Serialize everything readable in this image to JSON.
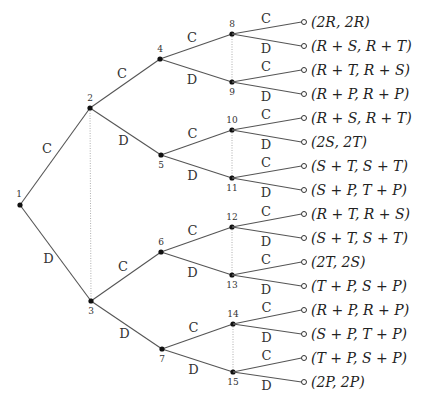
{
  "diagram": {
    "type": "game-tree",
    "nodes": [
      {
        "id": "1",
        "label": "1"
      },
      {
        "id": "2",
        "label": "2"
      },
      {
        "id": "3",
        "label": "3"
      },
      {
        "id": "4",
        "label": "4"
      },
      {
        "id": "5",
        "label": "5"
      },
      {
        "id": "6",
        "label": "6"
      },
      {
        "id": "7",
        "label": "7"
      },
      {
        "id": "8",
        "label": "8"
      },
      {
        "id": "9",
        "label": "9"
      },
      {
        "id": "10",
        "label": "10"
      },
      {
        "id": "11",
        "label": "11"
      },
      {
        "id": "12",
        "label": "12"
      },
      {
        "id": "13",
        "label": "13"
      },
      {
        "id": "14",
        "label": "14"
      },
      {
        "id": "15",
        "label": "15"
      }
    ],
    "edges": [
      {
        "from": "1",
        "to": "2",
        "action": "C"
      },
      {
        "from": "1",
        "to": "3",
        "action": "D"
      },
      {
        "from": "2",
        "to": "4",
        "action": "C"
      },
      {
        "from": "2",
        "to": "5",
        "action": "D"
      },
      {
        "from": "3",
        "to": "6",
        "action": "C"
      },
      {
        "from": "3",
        "to": "7",
        "action": "D"
      },
      {
        "from": "4",
        "to": "8",
        "action": "C"
      },
      {
        "from": "4",
        "to": "9",
        "action": "D"
      },
      {
        "from": "5",
        "to": "10",
        "action": "C"
      },
      {
        "from": "5",
        "to": "11",
        "action": "D"
      },
      {
        "from": "6",
        "to": "12",
        "action": "C"
      },
      {
        "from": "6",
        "to": "13",
        "action": "D"
      },
      {
        "from": "7",
        "to": "14",
        "action": "C"
      },
      {
        "from": "7",
        "to": "15",
        "action": "D"
      }
    ],
    "information_sets": [
      [
        "2",
        "3"
      ],
      [
        "8",
        "9"
      ],
      [
        "10",
        "11"
      ],
      [
        "12",
        "13"
      ],
      [
        "14",
        "15"
      ]
    ],
    "leaves": [
      {
        "parent": "8",
        "action": "C",
        "payoff": "(2R, 2R)"
      },
      {
        "parent": "8",
        "action": "D",
        "payoff": "(R + S, R + T)"
      },
      {
        "parent": "9",
        "action": "C",
        "payoff": "(R + T, R + S)"
      },
      {
        "parent": "9",
        "action": "D",
        "payoff": "(R + P, R + P)"
      },
      {
        "parent": "10",
        "action": "C",
        "payoff": "(R + S, R + T)"
      },
      {
        "parent": "10",
        "action": "D",
        "payoff": "(2S, 2T)"
      },
      {
        "parent": "11",
        "action": "C",
        "payoff": "(S + T, S + T)"
      },
      {
        "parent": "11",
        "action": "D",
        "payoff": "(S + P, T + P)"
      },
      {
        "parent": "12",
        "action": "C",
        "payoff": "(R + T, R + S)"
      },
      {
        "parent": "12",
        "action": "D",
        "payoff": "(S + T, S + T)"
      },
      {
        "parent": "13",
        "action": "C",
        "payoff": "(2T, 2S)"
      },
      {
        "parent": "13",
        "action": "D",
        "payoff": "(T + P, S + P)"
      },
      {
        "parent": "14",
        "action": "C",
        "payoff": "(R + P, R + P)"
      },
      {
        "parent": "14",
        "action": "D",
        "payoff": "(S + P, T + P)"
      },
      {
        "parent": "15",
        "action": "C",
        "payoff": "(T + P, S + P)"
      },
      {
        "parent": "15",
        "action": "D",
        "payoff": "(2P, 2P)"
      }
    ]
  }
}
